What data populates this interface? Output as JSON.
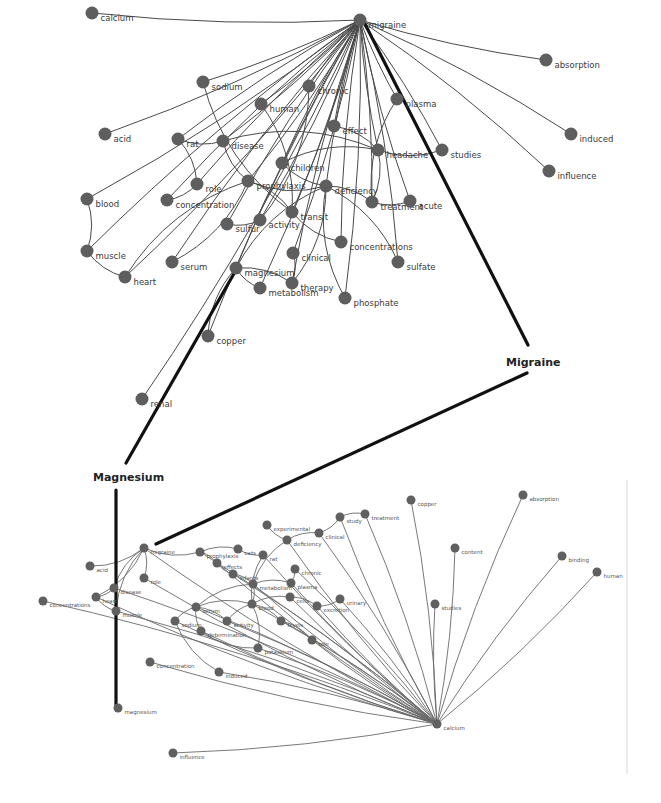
{
  "callouts": {
    "migraine": "Migraine",
    "magnesium": "Magnesium"
  },
  "colors": {
    "node": "#5e5e5e",
    "edge": "#4a4a4a",
    "connector": "#111111",
    "label": "#3a3a3a"
  },
  "top_graph": {
    "hub": {
      "id": "migraine",
      "label": "migraine",
      "x": 360,
      "y": 20
    },
    "nodes": [
      {
        "id": "calcium",
        "label": "calcium",
        "x": 92,
        "y": 13
      },
      {
        "id": "absorption",
        "label": "absorption",
        "x": 546,
        "y": 60
      },
      {
        "id": "sodium",
        "label": "sodium",
        "x": 203,
        "y": 82
      },
      {
        "id": "chronic",
        "label": "chronic",
        "x": 309,
        "y": 86
      },
      {
        "id": "human",
        "label": "human",
        "x": 261,
        "y": 104
      },
      {
        "id": "plasma",
        "label": "plasma",
        "x": 397,
        "y": 99
      },
      {
        "id": "acid",
        "label": "acid",
        "x": 105,
        "y": 134
      },
      {
        "id": "effect",
        "label": "effect",
        "x": 334,
        "y": 126
      },
      {
        "id": "induced",
        "label": "induced",
        "x": 571,
        "y": 134
      },
      {
        "id": "rat",
        "label": "rat",
        "x": 178,
        "y": 139
      },
      {
        "id": "disease",
        "label": "disease",
        "x": 223,
        "y": 141
      },
      {
        "id": "headache",
        "label": "headache",
        "x": 378,
        "y": 150
      },
      {
        "id": "studies",
        "label": "studies",
        "x": 442,
        "y": 150
      },
      {
        "id": "children",
        "label": "children",
        "x": 282,
        "y": 163
      },
      {
        "id": "influence",
        "label": "influence",
        "x": 549,
        "y": 171
      },
      {
        "id": "role",
        "label": "role",
        "x": 197,
        "y": 184
      },
      {
        "id": "prophylaxis",
        "label": "prophylaxis",
        "x": 248,
        "y": 181
      },
      {
        "id": "deficiency",
        "label": "deficiency",
        "x": 326,
        "y": 186
      },
      {
        "id": "blood",
        "label": "blood",
        "x": 87,
        "y": 199
      },
      {
        "id": "concentration",
        "label": "concentration",
        "x": 167,
        "y": 200
      },
      {
        "id": "treatment",
        "label": "treatment",
        "x": 372,
        "y": 202
      },
      {
        "id": "acute",
        "label": "acute",
        "x": 410,
        "y": 201
      },
      {
        "id": "transit",
        "label": "transit",
        "x": 292,
        "y": 212
      },
      {
        "id": "sulfur",
        "label": "sulfur",
        "x": 227,
        "y": 224
      },
      {
        "id": "activity",
        "label": "activity",
        "x": 260,
        "y": 220
      },
      {
        "id": "concentrations",
        "label": "concentrations",
        "x": 341,
        "y": 242
      },
      {
        "id": "muscle",
        "label": "muscle",
        "x": 87,
        "y": 251
      },
      {
        "id": "clinical",
        "label": "clinical",
        "x": 293,
        "y": 253
      },
      {
        "id": "serum",
        "label": "serum",
        "x": 172,
        "y": 262
      },
      {
        "id": "sulfate",
        "label": "sulfate",
        "x": 398,
        "y": 262
      },
      {
        "id": "magnesium",
        "label": "magnesium",
        "x": 236,
        "y": 268
      },
      {
        "id": "heart",
        "label": "heart",
        "x": 125,
        "y": 277
      },
      {
        "id": "metabolism",
        "label": "metabolism",
        "x": 260,
        "y": 288
      },
      {
        "id": "therapy",
        "label": "therapy",
        "x": 292,
        "y": 283
      },
      {
        "id": "phosphate",
        "label": "phosphate",
        "x": 345,
        "y": 298
      },
      {
        "id": "copper",
        "label": "copper",
        "x": 208,
        "y": 336
      },
      {
        "id": "renal",
        "label": "renal",
        "x": 142,
        "y": 399
      }
    ],
    "hub_edges": [
      "calcium",
      "absorption",
      "sodium",
      "chronic",
      "human",
      "plasma",
      "acid",
      "effect",
      "induced",
      "rat",
      "disease",
      "headache",
      "studies",
      "children",
      "influence",
      "role",
      "prophylaxis",
      "deficiency",
      "blood",
      "concentration",
      "treatment",
      "acute",
      "transit",
      "sulfur",
      "activity",
      "concentrations",
      "clinical",
      "serum",
      "sulfate",
      "magnesium",
      "metabolism",
      "therapy",
      "phosphate",
      "copper",
      "renal",
      "muscle",
      "heart"
    ],
    "edges": [
      [
        "blood",
        "muscle"
      ],
      [
        "muscle",
        "heart"
      ],
      [
        "rat",
        "role"
      ],
      [
        "rat",
        "disease"
      ],
      [
        "disease",
        "headache"
      ],
      [
        "disease",
        "prophylaxis"
      ],
      [
        "role",
        "concentration"
      ],
      [
        "prophylaxis",
        "deficiency"
      ],
      [
        "children",
        "headache"
      ],
      [
        "children",
        "deficiency"
      ],
      [
        "effect",
        "headache"
      ],
      [
        "headache",
        "studies"
      ],
      [
        "headache",
        "treatment"
      ],
      [
        "plasma",
        "treatment"
      ],
      [
        "deficiency",
        "sulfate"
      ],
      [
        "deficiency",
        "phosphate"
      ],
      [
        "deficiency",
        "treatment"
      ],
      [
        "transit",
        "concentrations"
      ],
      [
        "magnesium",
        "therapy"
      ],
      [
        "magnesium",
        "metabolism"
      ],
      [
        "clinical",
        "therapy"
      ],
      [
        "sulfur",
        "activity"
      ],
      [
        "human",
        "transit"
      ],
      [
        "sodium",
        "transit"
      ],
      [
        "chronic",
        "activity"
      ],
      [
        "treatment",
        "acute"
      ],
      [
        "magnesium",
        "deficiency"
      ],
      [
        "magnesium",
        "copper"
      ],
      [
        "prophylaxis",
        "transit"
      ],
      [
        "serum",
        "prophylaxis"
      ],
      [
        "heart",
        "prophylaxis"
      ],
      [
        "therapy",
        "deficiency"
      ]
    ]
  },
  "bottom_graph": {
    "hub": {
      "id": "calcium",
      "label": "calcium",
      "x": 437,
      "y": 724
    },
    "nodes": [
      {
        "id": "migraine",
        "label": "migraine",
        "x": 144,
        "y": 548
      },
      {
        "id": "magnesium",
        "label": "magnesium",
        "x": 118,
        "y": 708
      },
      {
        "id": "copper",
        "label": "copper",
        "x": 411,
        "y": 500
      },
      {
        "id": "absorption",
        "label": "absorption",
        "x": 523,
        "y": 495
      },
      {
        "id": "treatment",
        "label": "treatment",
        "x": 365,
        "y": 514
      },
      {
        "id": "study",
        "label": "study",
        "x": 340,
        "y": 517
      },
      {
        "id": "experimental",
        "label": "experimental",
        "x": 267,
        "y": 525
      },
      {
        "id": "clinical",
        "label": "clinical",
        "x": 319,
        "y": 533
      },
      {
        "id": "deficiency",
        "label": "deficiency",
        "x": 287,
        "y": 540
      },
      {
        "id": "content",
        "label": "content",
        "x": 455,
        "y": 548
      },
      {
        "id": "binding",
        "label": "binding",
        "x": 562,
        "y": 556
      },
      {
        "id": "human",
        "label": "human",
        "x": 597,
        "y": 572
      },
      {
        "id": "acid",
        "label": "acid",
        "x": 90,
        "y": 566
      },
      {
        "id": "prophylaxis",
        "label": "prophylaxis",
        "x": 200,
        "y": 552
      },
      {
        "id": "cats",
        "label": "cats",
        "x": 238,
        "y": 549
      },
      {
        "id": "rat",
        "label": "rat",
        "x": 263,
        "y": 555
      },
      {
        "id": "effects",
        "label": "effects",
        "x": 217,
        "y": 563
      },
      {
        "id": "role",
        "label": "role",
        "x": 144,
        "y": 578
      },
      {
        "id": "chronic",
        "label": "chronic",
        "x": 295,
        "y": 569
      },
      {
        "id": "infants",
        "label": "infants",
        "x": 233,
        "y": 574
      },
      {
        "id": "disease",
        "label": "disease",
        "x": 114,
        "y": 588
      },
      {
        "id": "heart",
        "label": "heart",
        "x": 96,
        "y": 597
      },
      {
        "id": "concentrations",
        "label": "concentrations",
        "x": 43,
        "y": 601
      },
      {
        "id": "metabolism",
        "label": "metabolism",
        "x": 253,
        "y": 584
      },
      {
        "id": "plasma",
        "label": "plasma",
        "x": 291,
        "y": 583
      },
      {
        "id": "studies",
        "label": "studies",
        "x": 435,
        "y": 604
      },
      {
        "id": "muscle",
        "label": "muscle",
        "x": 116,
        "y": 611
      },
      {
        "id": "cells",
        "label": "cells",
        "x": 290,
        "y": 597
      },
      {
        "id": "urinary",
        "label": "urinary",
        "x": 340,
        "y": 599
      },
      {
        "id": "excretion",
        "label": "excretion",
        "x": 317,
        "y": 606
      },
      {
        "id": "serum",
        "label": "serum",
        "x": 196,
        "y": 607
      },
      {
        "id": "blood",
        "label": "blood",
        "x": 252,
        "y": 604
      },
      {
        "id": "sodium",
        "label": "sodium",
        "x": 175,
        "y": 621
      },
      {
        "id": "activity",
        "label": "activity",
        "x": 227,
        "y": 621
      },
      {
        "id": "levels",
        "label": "levels",
        "x": 281,
        "y": 621
      },
      {
        "id": "determination",
        "label": "determination",
        "x": 201,
        "y": 631
      },
      {
        "id": "role2",
        "label": "role",
        "x": 312,
        "y": 640
      },
      {
        "id": "potassium",
        "label": "potassium",
        "x": 258,
        "y": 648
      },
      {
        "id": "concentration",
        "label": "concentration",
        "x": 150,
        "y": 662
      },
      {
        "id": "induced",
        "label": "induced",
        "x": 219,
        "y": 672
      },
      {
        "id": "influence",
        "label": "influence",
        "x": 173,
        "y": 753
      }
    ],
    "hub_edges": [
      "migraine",
      "copper",
      "absorption",
      "treatment",
      "study",
      "content",
      "binding",
      "human",
      "studies",
      "concentrations",
      "concentration",
      "induced",
      "influence",
      "potassium",
      "role2",
      "levels",
      "excretion",
      "urinary",
      "cells",
      "blood",
      "plasma",
      "serum",
      "sodium",
      "activity",
      "determination",
      "clinical",
      "deficiency",
      "muscle",
      "heart",
      "disease",
      "role",
      "prophylaxis",
      "effects",
      "infants",
      "metabolism",
      "chronic",
      "rat"
    ],
    "edges": [
      [
        "migraine",
        "acid"
      ],
      [
        "migraine",
        "disease"
      ],
      [
        "migraine",
        "role"
      ],
      [
        "migraine",
        "prophylaxis"
      ],
      [
        "migraine",
        "heart"
      ],
      [
        "migraine",
        "muscle"
      ],
      [
        "prophylaxis",
        "cats"
      ],
      [
        "cats",
        "rat"
      ],
      [
        "prophylaxis",
        "effects"
      ],
      [
        "effects",
        "infants"
      ],
      [
        "infants",
        "metabolism"
      ],
      [
        "experimental",
        "deficiency"
      ],
      [
        "deficiency",
        "clinical"
      ],
      [
        "clinical",
        "study"
      ],
      [
        "study",
        "treatment"
      ],
      [
        "deficiency",
        "metabolism"
      ],
      [
        "chronic",
        "plasma"
      ],
      [
        "plasma",
        "metabolism"
      ],
      [
        "cells",
        "excretion"
      ],
      [
        "excretion",
        "urinary"
      ],
      [
        "blood",
        "levels"
      ],
      [
        "serum",
        "sodium"
      ],
      [
        "serum",
        "activity"
      ],
      [
        "serum",
        "determination"
      ],
      [
        "activity",
        "blood"
      ],
      [
        "determination",
        "potassium"
      ],
      [
        "levels",
        "role2"
      ],
      [
        "heart",
        "muscle"
      ],
      [
        "disease",
        "heart"
      ],
      [
        "rat",
        "blood"
      ],
      [
        "metabolism",
        "blood"
      ],
      [
        "cells",
        "blood"
      ],
      [
        "serum",
        "blood"
      ],
      [
        "metabolism",
        "serum"
      ],
      [
        "induced",
        "sodium"
      ],
      [
        "potassium",
        "blood"
      ]
    ]
  },
  "connectors": [
    {
      "from": [
        364,
        22
      ],
      "to": [
        528,
        345
      ],
      "name": "connector-top-migraine-to-callout"
    },
    {
      "from": [
        527,
        373
      ],
      "to": [
        156,
        544
      ],
      "name": "connector-callout-to-bottom-migraine"
    },
    {
      "from": [
        236,
        270
      ],
      "to": [
        126,
        463
      ],
      "name": "connector-top-magnesium-to-callout"
    },
    {
      "from": [
        116,
        490
      ],
      "to": [
        116,
        705
      ],
      "name": "connector-callout-to-bottom-magnesium"
    }
  ],
  "callout_positions": {
    "migraine": {
      "x": 506,
      "y": 366
    },
    "magnesium": {
      "x": 93,
      "y": 481
    }
  }
}
